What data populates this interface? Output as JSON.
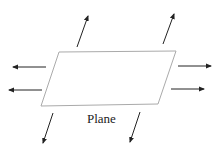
{
  "diagram": {
    "label": "Plane",
    "plane_color": "#aaaaaa",
    "arrow_color": "#222222",
    "arrows": [
      {
        "name": "up-left",
        "x1": 77,
        "y1": 47,
        "x2": 88,
        "y2": 16
      },
      {
        "name": "up-right",
        "x1": 163,
        "y1": 44,
        "x2": 174,
        "y2": 14
      },
      {
        "name": "left-top",
        "x1": 46,
        "y1": 67,
        "x2": 13,
        "y2": 67
      },
      {
        "name": "left-bottom",
        "x1": 42,
        "y1": 90,
        "x2": 9,
        "y2": 90
      },
      {
        "name": "right-top",
        "x1": 178,
        "y1": 66,
        "x2": 211,
        "y2": 66
      },
      {
        "name": "right-bottom",
        "x1": 171,
        "y1": 89,
        "x2": 204,
        "y2": 89
      },
      {
        "name": "down-left",
        "x1": 53,
        "y1": 113,
        "x2": 43,
        "y2": 143
      },
      {
        "name": "down-right",
        "x1": 140,
        "y1": 112,
        "x2": 130,
        "y2": 142
      }
    ]
  }
}
